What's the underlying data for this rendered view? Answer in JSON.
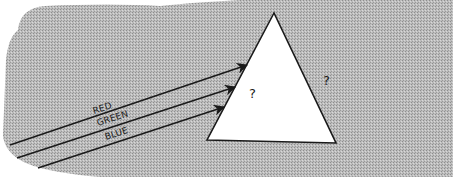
{
  "diagram": {
    "background_color": "#ffffff",
    "field_color": "#b9b9b9",
    "field_pattern_dark": "#8e8e8e",
    "field_pattern_light": "#d8d8d8",
    "line_color": "#1a1a1a",
    "prism": {
      "fill": "#ffffff",
      "apex": [
        274,
        13
      ],
      "bottom_left": [
        207,
        140
      ],
      "bottom_right": [
        336,
        143
      ],
      "inside_label": "?",
      "outside_label": "?"
    },
    "rays": [
      {
        "label": "RED",
        "start": [
          10,
          145
        ],
        "end": [
          247,
          65
        ]
      },
      {
        "label": "GREEN",
        "start": [
          17,
          158
        ],
        "end": [
          235,
          87
        ]
      },
      {
        "label": "BLUE",
        "start": [
          38,
          168
        ],
        "end": [
          224,
          107
        ]
      }
    ]
  }
}
